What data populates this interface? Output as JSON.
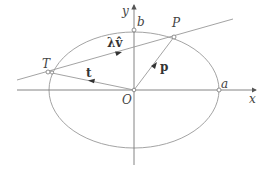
{
  "diagram": {
    "type": "ellipse-tangent-construction",
    "labels": {
      "x_axis": "x",
      "y_axis": "y",
      "origin": "O",
      "semi_major": "a",
      "semi_minor": "b",
      "point_P": "P",
      "point_T": "T",
      "vector_t": "t",
      "vector_p": "p",
      "direction": "λv̂"
    },
    "colors": {
      "stroke": "#888888",
      "text": "#444444",
      "arrow": "#333333"
    }
  }
}
